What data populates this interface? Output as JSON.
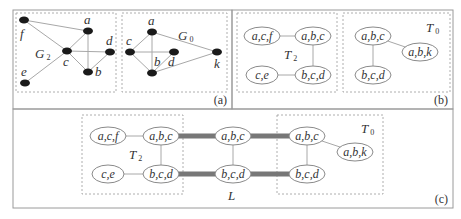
{
  "panels": {
    "a": {
      "label": "(a)",
      "graphs": [
        {
          "name": "G",
          "subscript": "2",
          "nodes": [
            {
              "id": "f",
              "x": 24,
              "y": 20,
              "lx": 20,
              "ly": 38
            },
            {
              "id": "a",
              "x": 88,
              "y": 31,
              "lx": 84,
              "ly": 24
            },
            {
              "id": "c",
              "x": 67,
              "y": 51,
              "lx": 63,
              "ly": 66
            },
            {
              "id": "d",
              "x": 110,
              "y": 52,
              "lx": 106,
              "ly": 45
            },
            {
              "id": "b",
              "x": 88,
              "y": 72,
              "lx": 95,
              "ly": 76
            },
            {
              "id": "e",
              "x": 25,
              "y": 83,
              "lx": 21,
              "ly": 76
            }
          ],
          "edges": [
            [
              "f",
              "a"
            ],
            [
              "f",
              "c"
            ],
            [
              "a",
              "c"
            ],
            [
              "a",
              "b"
            ],
            [
              "c",
              "d"
            ],
            [
              "c",
              "b"
            ],
            [
              "d",
              "b"
            ],
            [
              "c",
              "e"
            ]
          ]
        },
        {
          "name": "G",
          "subscript": "0",
          "nodes": [
            {
              "id": "a",
              "x": 152,
              "y": 32,
              "lx": 148,
              "ly": 25
            },
            {
              "id": "c",
              "x": 130,
              "y": 52,
              "lx": 126,
              "ly": 45
            },
            {
              "id": "d",
              "x": 174,
              "y": 52,
              "lx": 168,
              "ly": 66
            },
            {
              "id": "b",
              "x": 152,
              "y": 73,
              "lx": 154,
              "ly": 66
            },
            {
              "id": "k",
              "x": 217,
              "y": 52,
              "lx": 214,
              "ly": 68
            }
          ],
          "edges": [
            [
              "a",
              "c"
            ],
            [
              "a",
              "b"
            ],
            [
              "a",
              "k"
            ],
            [
              "c",
              "d"
            ],
            [
              "c",
              "b"
            ],
            [
              "d",
              "b"
            ],
            [
              "b",
              "k"
            ]
          ]
        }
      ]
    },
    "b": {
      "label": "(b)",
      "trees": [
        {
          "name": "T",
          "subscript": "2",
          "nodes": [
            {
              "id": "acf",
              "text": "a,c,f",
              "x": 262,
              "y": 36
            },
            {
              "id": "abc",
              "text": "a,b,c",
              "x": 313,
              "y": 36
            },
            {
              "id": "ce",
              "text": "c,e",
              "x": 262,
              "y": 75
            },
            {
              "id": "bcd",
              "text": "b,c,d",
              "x": 313,
              "y": 75
            }
          ],
          "edges": [
            [
              "acf",
              "abc"
            ],
            [
              "abc",
              "bcd"
            ],
            [
              "ce",
              "bcd"
            ]
          ]
        },
        {
          "name": "T",
          "subscript": "0",
          "nodes": [
            {
              "id": "abc",
              "text": "a,b,c",
              "x": 373,
              "y": 36
            },
            {
              "id": "abk",
              "text": "a,b,k",
              "x": 420,
              "y": 52
            },
            {
              "id": "bcd",
              "text": "b,c,d",
              "x": 373,
              "y": 75
            }
          ],
          "edges": [
            [
              "abc",
              "abk"
            ],
            [
              "abc",
              "bcd"
            ]
          ]
        }
      ]
    },
    "c": {
      "label": "(c)",
      "trees": [
        {
          "name": "T",
          "subscript": "2",
          "nodes": [
            {
              "id": "acf",
              "text": "a,c,f",
              "x": 108,
              "y": 136
            },
            {
              "id": "abc",
              "text": "a,b,c",
              "x": 161,
              "y": 136
            },
            {
              "id": "ce",
              "text": "c,e",
              "x": 108,
              "y": 174
            },
            {
              "id": "bcd",
              "text": "b,c,d",
              "x": 161,
              "y": 174
            }
          ]
        },
        {
          "name": "L",
          "nodes": [
            {
              "id": "abc",
              "text": "a,b,c",
              "x": 233,
              "y": 136
            },
            {
              "id": "bcd",
              "text": "b,c,d",
              "x": 233,
              "y": 174
            }
          ]
        },
        {
          "name": "T",
          "subscript": "0",
          "nodes": [
            {
              "id": "abc",
              "text": "a,b,c",
              "x": 307,
              "y": 136
            },
            {
              "id": "abk",
              "text": "a,b,k",
              "x": 355,
              "y": 152
            },
            {
              "id": "bcd",
              "text": "b,c,d",
              "x": 307,
              "y": 174
            }
          ]
        }
      ]
    }
  }
}
